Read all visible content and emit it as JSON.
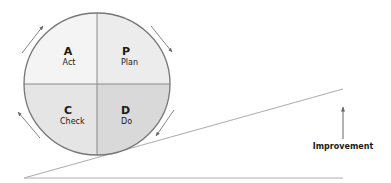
{
  "diagram": {
    "quadrants": [
      {
        "id": "act",
        "letter": "A",
        "word": "Act",
        "position": "top-left",
        "fill": "#f4f4f4"
      },
      {
        "id": "plan",
        "letter": "P",
        "word": "Plan",
        "position": "top-right",
        "fill": "#ececec"
      },
      {
        "id": "check",
        "letter": "C",
        "word": "Check",
        "position": "bottom-left",
        "fill": "#e5e5e5"
      },
      {
        "id": "do",
        "letter": "D",
        "word": "Do",
        "position": "bottom-right",
        "fill": "#d9d9d9"
      }
    ],
    "cycle_arrows": [
      {
        "id": "top-left",
        "direction": "up-right"
      },
      {
        "id": "top-right",
        "direction": "down-right"
      },
      {
        "id": "bottom-right",
        "direction": "down-left"
      },
      {
        "id": "bottom-left",
        "direction": "up-left"
      }
    ],
    "improvement_label": "Improvement",
    "colors": {
      "outline": "#777777",
      "line": "#aaaaaa",
      "arrow": "#666666",
      "text": "#1a1a1a"
    }
  }
}
